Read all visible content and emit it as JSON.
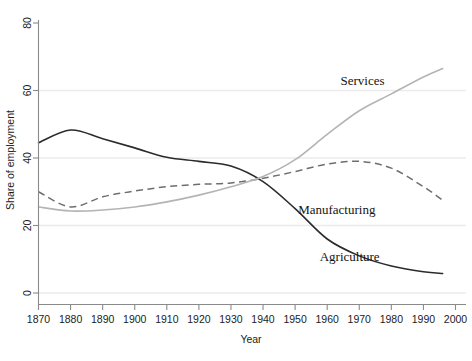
{
  "chart_data": {
    "type": "line",
    "title": "",
    "xlabel": "Year",
    "ylabel": "Share of employment",
    "xlim": [
      1870,
      2000
    ],
    "ylim": [
      0,
      80
    ],
    "grid": true,
    "gridlines_y": [
      0,
      20,
      40,
      60
    ],
    "legend_position": "inline-labels",
    "xticks": [
      1870,
      1880,
      1890,
      1900,
      1910,
      1920,
      1930,
      1940,
      1950,
      1960,
      1970,
      1980,
      1990,
      2000
    ],
    "xtick_labels": [
      "1870",
      "1880",
      "1890",
      "1900",
      "1910",
      "1920",
      "1930",
      "1940",
      "1950",
      "1960",
      "1970",
      "1980",
      "1990",
      "2000"
    ],
    "yticks": [
      0,
      20,
      40,
      60,
      80
    ],
    "ytick_labels": [
      "0",
      "20",
      "40",
      "60",
      "80"
    ],
    "x": [
      1870,
      1880,
      1890,
      1900,
      1910,
      1920,
      1930,
      1940,
      1950,
      1960,
      1970,
      1980,
      1990,
      1996
    ],
    "series": [
      {
        "name": "Agriculture",
        "style": "solid",
        "color": "#2b2b2b",
        "label_x": 1967,
        "label_y": 9.5,
        "values": [
          44.5,
          48.3,
          45.7,
          43.0,
          40.2,
          39.0,
          37.6,
          33.0,
          25.0,
          16.0,
          11.0,
          8.0,
          6.3,
          5.8
        ]
      },
      {
        "name": "Manufacturing",
        "style": "dashed",
        "color": "#6e6e6e",
        "label_x": 1963,
        "label_y": 23.5,
        "values": [
          30.0,
          25.5,
          28.5,
          30.2,
          31.5,
          32.2,
          32.6,
          34.0,
          36.0,
          38.2,
          39.0,
          37.0,
          31.5,
          27.5
        ]
      },
      {
        "name": "Services",
        "style": "solid",
        "color": "#b4b4b4",
        "label_x": 1971,
        "label_y": 61.5,
        "values": [
          25.5,
          24.3,
          24.6,
          25.5,
          27.0,
          29.0,
          31.5,
          34.5,
          39.5,
          47.0,
          54.0,
          59.0,
          64.0,
          66.5
        ]
      }
    ]
  },
  "axis": {
    "x_title": "Year",
    "y_title": "Share of employment"
  }
}
